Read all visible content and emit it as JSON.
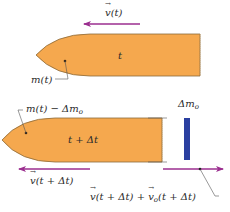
{
  "colors": {
    "rocket_fill": "#F5A84E",
    "rocket_stroke": "#8a6a3a",
    "arrow": "#9B2E8F",
    "ejected_mass": "#2A3FA0",
    "leader": "#555555"
  },
  "top_panel": {
    "velocity_label_symbol": "v",
    "velocity_label_arg": "(t)",
    "time_label": "t",
    "mass_label": "m(t)"
  },
  "bottom_panel": {
    "mass_label_prefix": "m(t) − Δm",
    "mass_label_sub": "o",
    "time_label": "t + Δt",
    "ejected_label_prefix": "Δm",
    "ejected_label_sub": "o",
    "rocket_velocity_symbol": "v",
    "rocket_velocity_arg": "(t + Δt)",
    "ejected_velocity_sym1": "v",
    "ejected_velocity_arg1": "(t + Δt) + ",
    "ejected_velocity_sym2": "v",
    "ejected_velocity_sub2": "o",
    "ejected_velocity_arg2": "(t + Δt)"
  }
}
